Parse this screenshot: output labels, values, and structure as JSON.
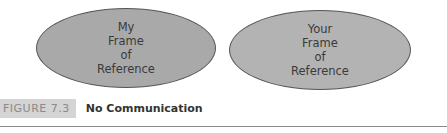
{
  "diagram": {
    "ellipses": [
      {
        "lines": [
          "My",
          "Frame",
          "of",
          "Reference"
        ],
        "fill": "#a9a9a9"
      },
      {
        "lines": [
          "Your",
          "Frame",
          "of",
          "Reference"
        ],
        "fill": "#b3b3b3"
      }
    ]
  },
  "caption": {
    "tag": "FIGURE 7.3",
    "title": "No Communication"
  }
}
